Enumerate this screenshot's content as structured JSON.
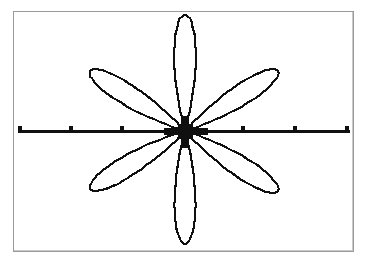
{
  "screen": {
    "device": "graphing-calculator-screen",
    "background_color": "#ffffff",
    "border_color": "#9b9b9b",
    "ink_color": "#101010"
  },
  "chart_data": {
    "type": "line",
    "title": "",
    "subtitle": "",
    "xlabel": "",
    "ylabel": "",
    "plot_kind": "polar-rose",
    "equation": "r = a cos(3θ)",
    "petal_count": 6,
    "grid": false,
    "legend": false,
    "legend_position": "none",
    "xlim": [
      -3.26,
      3.26
    ],
    "ylim": [
      -2.3,
      2.3
    ],
    "axes": {
      "x_axis_visible": true,
      "y_axis_visible": false,
      "x_axis_y_pixel": 130,
      "x_axis_start_pixel": 18,
      "x_axis_end_pixel": 350,
      "x_axis_thickness_px": 3,
      "tick_spacing_units": 1,
      "x_tick_pixels": [
        20,
        71,
        122,
        243,
        295,
        347
      ],
      "x_tick_values": [
        -3,
        -2,
        -1,
        1,
        2,
        3
      ]
    },
    "center_pixel": [
      185,
      130
    ],
    "petal_tips_pixels": [
      [
        185,
        14
      ],
      [
        278,
        70
      ],
      [
        278,
        190
      ],
      [
        185,
        243
      ],
      [
        90,
        188
      ],
      [
        90,
        70
      ]
    ],
    "petal_tip_angles_deg": [
      90,
      31,
      -31,
      -90,
      211,
      149
    ],
    "petal_half_width_deg": 15,
    "radius_vertical_px": 116,
    "radius_diagonal_px": 109,
    "series": [
      {
        "name": "rose",
        "description": "six-petal polar rose outline, pixelated rendering",
        "theta_samples_deg": [
          0,
          30,
          60,
          90,
          120,
          150,
          180,
          210,
          240,
          270,
          300,
          330,
          360
        ],
        "r_values": [
          0,
          1,
          0,
          1,
          0,
          1,
          0,
          1,
          0,
          1,
          0,
          1,
          0
        ]
      }
    ]
  }
}
